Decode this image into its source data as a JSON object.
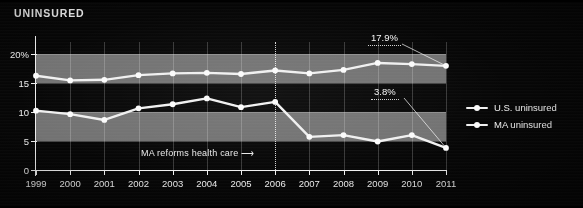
{
  "header": {
    "title": "UNINSURED"
  },
  "legend": {
    "position": "right",
    "items": [
      {
        "label": "U.S. uninsured",
        "marker": "line-dot-marker"
      },
      {
        "label": "MA uninsured",
        "marker": "line-dot-marker"
      }
    ]
  },
  "annotations": {
    "us_callout": "17.9%",
    "ma_callout": "3.8%",
    "reform_note": "MA reforms health care ⟶",
    "reform_year": "2006"
  },
  "colors": {
    "background": "#060606",
    "series_line": "#f0f0f0",
    "band": "#8d8d8d",
    "axis": "#efefef",
    "text": "#f0f0f0"
  },
  "chart_data": {
    "type": "line",
    "title": "UNINSURED",
    "xlabel": "",
    "ylabel": "",
    "grid": true,
    "legend_position": "right",
    "x": [
      1999,
      2000,
      2001,
      2002,
      2003,
      2004,
      2005,
      2006,
      2007,
      2008,
      2009,
      2010,
      2011
    ],
    "categories": [
      "1999",
      "2000",
      "2001",
      "2002",
      "2003",
      "2004",
      "2005",
      "2006",
      "2007",
      "2008",
      "2009",
      "2010",
      "2011"
    ],
    "ylim": [
      0,
      22
    ],
    "yticks": [
      0,
      5,
      10,
      15,
      20
    ],
    "ytick_labels": [
      "0",
      "5",
      "10",
      "15",
      "20%"
    ],
    "series": [
      {
        "name": "U.S. uninsured",
        "values": [
          16.2,
          15.4,
          15.5,
          16.3,
          16.6,
          16.7,
          16.5,
          17.1,
          16.6,
          17.2,
          18.4,
          18.2,
          17.9
        ]
      },
      {
        "name": "MA uninsured",
        "values": [
          10.2,
          9.6,
          8.6,
          10.6,
          11.3,
          12.3,
          10.8,
          11.7,
          5.7,
          6.0,
          4.9,
          6.0,
          3.8
        ]
      }
    ],
    "annotations": [
      {
        "text": "17.9%",
        "series": "U.S. uninsured",
        "x": 2011,
        "y": 17.9
      },
      {
        "text": "3.8%",
        "series": "MA uninsured",
        "x": 2011,
        "y": 3.8
      },
      {
        "text": "MA reforms health care ⟶",
        "x": 2006,
        "type": "vertical-marker"
      }
    ],
    "shaded_bands": [
      [
        5,
        10
      ],
      [
        15,
        20
      ]
    ]
  }
}
